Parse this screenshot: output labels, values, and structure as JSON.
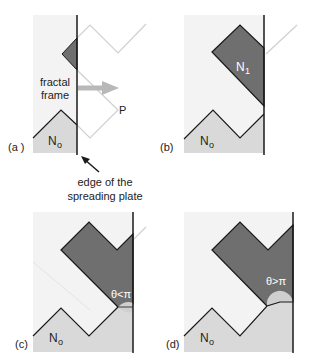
{
  "figure": {
    "colors": {
      "frame_bg": "#f3f3f3",
      "n0_fill": "#d9d9d9",
      "n1_fill": "#6f6f6f",
      "outline_light": "#d0d0d0",
      "edge_line": "#1a1a1a",
      "arrow_gray": "#b8b8b8",
      "lens_fill": "#cfcfcf"
    },
    "panels": [
      {
        "id": "a",
        "label": "(a )",
        "region_label": "No",
        "region_label_main": "N",
        "region_label_sub": "o",
        "annotation_fractal": [
          "fractal",
          "frame"
        ],
        "point_label": "P",
        "edge_caption": [
          "edge of the",
          "spreading plate"
        ]
      },
      {
        "id": "b",
        "label": "(b)",
        "region_label_main": "N",
        "region_label_sub": "o",
        "n1_label_main": "N",
        "n1_label_sub": "1"
      },
      {
        "id": "c",
        "label": "(c)",
        "region_label_main": "N",
        "region_label_sub": "o",
        "angle_label": "θ<π"
      },
      {
        "id": "d",
        "label": "(d)",
        "region_label_main": "N",
        "region_label_sub": "o",
        "angle_label": "θ>π"
      }
    ]
  }
}
